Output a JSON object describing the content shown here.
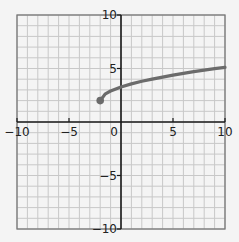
{
  "chart_data": {
    "type": "line",
    "title": "",
    "xlabel": "",
    "ylabel": "",
    "xlim": [
      -10,
      10
    ],
    "ylim": [
      -10,
      10
    ],
    "grid": true,
    "grid_step": 1,
    "x_ticks": [
      -10,
      -5,
      0,
      5,
      10
    ],
    "y_ticks": [
      10,
      5,
      -5,
      -10
    ],
    "x_tick_labels": [
      "−10",
      "−5",
      "0",
      "5",
      "10"
    ],
    "y_tick_labels": [
      "10",
      "5",
      "−5",
      "−10"
    ],
    "series": [
      {
        "name": "curve",
        "color": "#6b6b6b",
        "start_point": {
          "x": -2,
          "y": 2,
          "marker": "closed-dot"
        },
        "x": [
          -2,
          -1.5,
          -1,
          0,
          1,
          2,
          3,
          4,
          5,
          6,
          7,
          8,
          9,
          10
        ],
        "y": [
          2,
          2.64,
          2.9,
          3.27,
          3.56,
          3.8,
          4.01,
          4.2,
          4.38,
          4.55,
          4.7,
          4.85,
          4.98,
          5.1
        ]
      }
    ]
  },
  "colors": {
    "background": "#f4f4f4",
    "grid": "#c8c8c8",
    "border": "#777777",
    "axis": "#1a1a1a",
    "curve": "#6b6b6b"
  }
}
